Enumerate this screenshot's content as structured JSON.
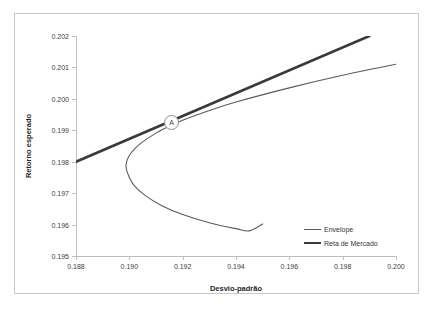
{
  "chart_data": {
    "type": "line",
    "title": "",
    "xlabel": "Desvio-padrão",
    "ylabel": "Retorno esperado",
    "xlim": [
      0.188,
      0.2
    ],
    "ylim": [
      0.195,
      0.202
    ],
    "xticks": [
      "0.188",
      "0.190",
      "0.192",
      "0.194",
      "0.196",
      "0.198",
      "0.200"
    ],
    "xtick_values": [
      0.188,
      0.19,
      0.192,
      0.194,
      0.196,
      0.198,
      0.2
    ],
    "yticks": [
      "0.195",
      "0.196",
      "0.197",
      "0.198",
      "0.199",
      "0.200",
      "0.201",
      "0.202"
    ],
    "ytick_values": [
      0.195,
      0.196,
      0.197,
      0.198,
      0.199,
      0.2,
      0.201,
      0.202
    ],
    "grid": false,
    "legend_position": "bottom-right",
    "series": [
      {
        "name": "Envelope",
        "style": "thin",
        "color": "#5a5a5a",
        "comment": "hyperbolic efficient frontier, vertex at minimum variance point",
        "points": [
          [
            0.2,
            0.2011
          ],
          [
            0.198,
            0.20075
          ],
          [
            0.196,
            0.20035
          ],
          [
            0.194,
            0.1999
          ],
          [
            0.193,
            0.19963
          ],
          [
            0.192,
            0.19932
          ],
          [
            0.1915,
            0.19913
          ],
          [
            0.191,
            0.19891
          ],
          [
            0.1905,
            0.19863
          ],
          [
            0.1902,
            0.19841
          ],
          [
            0.19,
            0.1982
          ],
          [
            0.1899,
            0.198
          ],
          [
            0.18988,
            0.1978
          ],
          [
            0.19,
            0.1975
          ],
          [
            0.1902,
            0.19722
          ],
          [
            0.1906,
            0.19692
          ],
          [
            0.1912,
            0.19661
          ],
          [
            0.192,
            0.19632
          ],
          [
            0.193,
            0.19606
          ],
          [
            0.194,
            0.19587
          ],
          [
            0.1945,
            0.1958
          ],
          [
            0.195,
            0.19602
          ]
        ]
      },
      {
        "name": "Reta de Mercado",
        "style": "thick",
        "color": "#3a3a3a",
        "comment": "capital market line tangent to envelope at point A",
        "points": [
          [
            0.188,
            0.198
          ],
          [
            0.199,
            0.202
          ]
        ]
      }
    ],
    "annotations": [
      {
        "label": "A",
        "kind": "circled-point-marker",
        "x": 0.19155,
        "y": 0.19929
      }
    ]
  },
  "legend": {
    "items": [
      {
        "label": "Envelope"
      },
      {
        "label": "Reta de Mercado"
      }
    ]
  }
}
